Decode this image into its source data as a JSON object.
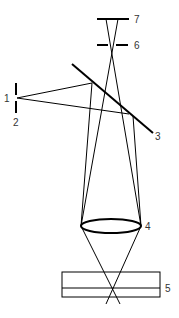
{
  "colors": {
    "line": "#000000",
    "label": "#333333",
    "background": "#ffffff"
  },
  "labels": {
    "l1": "1",
    "l2": "2",
    "l3": "3",
    "l4": "4",
    "l5": "5",
    "l6": "6",
    "l7": "7"
  },
  "components": [
    {
      "id": "1",
      "name": "light source point"
    },
    {
      "id": "2",
      "name": "source aperture"
    },
    {
      "id": "3",
      "name": "beam splitter"
    },
    {
      "id": "4",
      "name": "objective lens"
    },
    {
      "id": "5",
      "name": "specimen"
    },
    {
      "id": "6",
      "name": "detector pinhole"
    },
    {
      "id": "7",
      "name": "detector"
    }
  ]
}
